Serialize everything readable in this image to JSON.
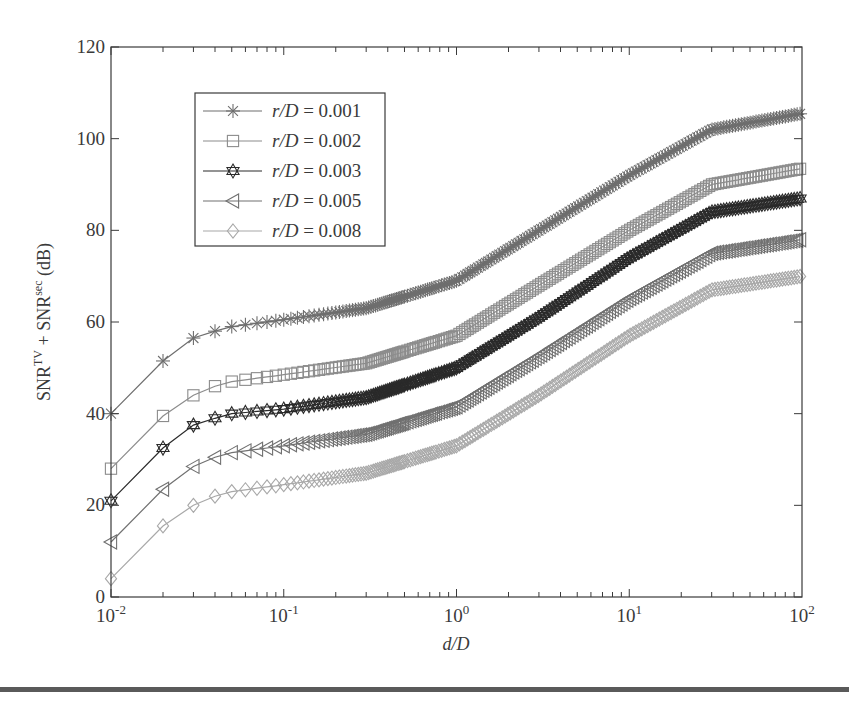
{
  "chart_data": {
    "type": "line",
    "title": "",
    "xlabel": "d/D",
    "ylabel": "SNR^TV + SNR^sec (dB)",
    "ylabel_parts": {
      "base1": "SNR",
      "sup1": "TV",
      "plus": " + ",
      "base2": "SNR",
      "sup2": "sec",
      "unit": " (dB)"
    },
    "xscale": "log",
    "xlim": [
      0.01,
      100
    ],
    "ylim": [
      0,
      120
    ],
    "grid": false,
    "legend_position": "upper left (inset)",
    "x_ticks": [
      {
        "value": 0.01,
        "base": "10",
        "exp": "-2"
      },
      {
        "value": 0.1,
        "base": "10",
        "exp": "-1"
      },
      {
        "value": 1,
        "base": "10",
        "exp": "0"
      },
      {
        "value": 10,
        "base": "10",
        "exp": "1"
      },
      {
        "value": 100,
        "base": "10",
        "exp": "2"
      }
    ],
    "y_ticks": [
      "0",
      "20",
      "40",
      "60",
      "80",
      "100",
      "120"
    ],
    "x": [
      0.01,
      0.02,
      0.03,
      0.04,
      0.05,
      0.1,
      0.3,
      1,
      3,
      10,
      30,
      100
    ],
    "series": [
      {
        "name": "r/D = 0.001",
        "label_var": "r/D",
        "label_val": "= 0.001",
        "marker": "asterisk",
        "color": "#6e6e6e",
        "values": [
          40,
          51.5,
          56.5,
          58,
          59,
          60.5,
          63,
          69,
          80,
          92,
          102,
          105.5
        ]
      },
      {
        "name": "r/D = 0.002",
        "label_var": "r/D",
        "label_val": "= 0.002",
        "marker": "square",
        "color": "#8c8c8c",
        "values": [
          28,
          39.5,
          44,
          46,
          47,
          48.5,
          51,
          57,
          68,
          80,
          90,
          93.5
        ]
      },
      {
        "name": "r/D = 0.003",
        "label_var": "r/D",
        "label_val": "= 0.003",
        "marker": "hexagram",
        "color": "#2a2a2a",
        "values": [
          21,
          32.5,
          37.5,
          39,
          40,
          41,
          43.5,
          50,
          61,
          74,
          84,
          87
        ]
      },
      {
        "name": "r/D = 0.005",
        "label_var": "r/D",
        "label_val": "= 0.005",
        "marker": "triangle-left",
        "color": "#717171",
        "values": [
          12,
          23.5,
          28.5,
          30.5,
          31.5,
          33,
          35.5,
          41.5,
          52.5,
          65,
          75,
          78
        ]
      },
      {
        "name": "r/D = 0.008",
        "label_var": "r/D",
        "label_val": "= 0.008",
        "marker": "diamond",
        "color": "#a8a8a8",
        "values": [
          4,
          15.5,
          20,
          22,
          23,
          24.5,
          27,
          33,
          44,
          57,
          67,
          70
        ]
      }
    ]
  }
}
